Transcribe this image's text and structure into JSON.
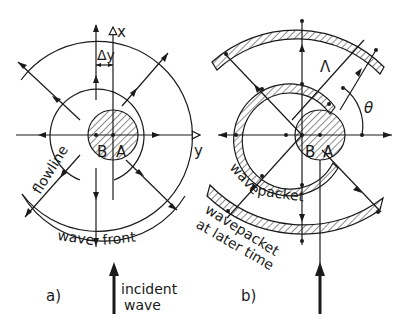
{
  "panels": [
    {
      "id": "a",
      "label": "a)",
      "axes": {
        "x_label": "x",
        "y_label": "y"
      },
      "points": [
        "B",
        "A"
      ],
      "delta_label": "Δy",
      "curve_labels": {
        "flowline": "flowline",
        "wavefront_1": "wave",
        "wavefront_2": "front"
      },
      "incident": {
        "line1": "incident",
        "line2": "wave"
      }
    },
    {
      "id": "b",
      "label": "b)",
      "points": [
        "B",
        "A"
      ],
      "symbols": {
        "wavelength": "Λ",
        "angle": "θ"
      },
      "packet_label": "wave packet",
      "packet_words": [
        "wave",
        "packet"
      ],
      "later_label": {
        "line1": "wavepacket",
        "line2": "at later time"
      }
    }
  ],
  "colors": {
    "ink": "#1a1a1a",
    "background": "#ffffff"
  }
}
